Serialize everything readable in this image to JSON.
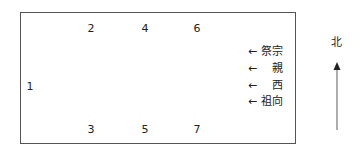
{
  "diagram": {
    "positions": [
      {
        "id": "1",
        "label": "1"
      },
      {
        "id": "2",
        "label": "2"
      },
      {
        "id": "3",
        "label": "3"
      },
      {
        "id": "4",
        "label": "4"
      },
      {
        "id": "5",
        "label": "5"
      },
      {
        "id": "6",
        "label": "6"
      },
      {
        "id": "7",
        "label": "7"
      }
    ],
    "annotations": [
      {
        "text": "← 祭宗"
      },
      {
        "text": "←　 親"
      },
      {
        "text": "←　 西"
      },
      {
        "text": "← 祖向"
      }
    ],
    "compass": {
      "label": "北",
      "direction": "up"
    },
    "colors": {
      "border": "#555555",
      "text": "#222222",
      "arrow": "#777777"
    }
  }
}
